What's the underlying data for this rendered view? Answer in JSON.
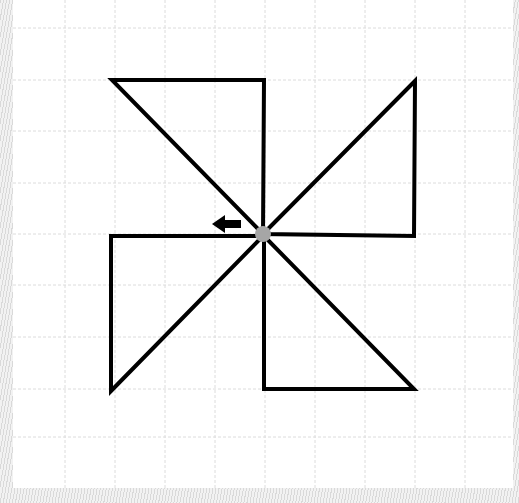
{
  "diagram": {
    "title": "",
    "grid": {
      "vertical_lines_x": [
        65,
        115,
        165,
        215,
        265,
        315,
        365,
        415,
        465
      ],
      "horizontal_lines_y": [
        28,
        80,
        131,
        183,
        234,
        285,
        337,
        389,
        437
      ],
      "color": "#d8d8d8"
    },
    "shape_stroke_color": "#000000",
    "triangles": [
      {
        "name": "top-left",
        "points": "112,80 264,80 263,234"
      },
      {
        "name": "top-right",
        "points": "263,234 415,81 414,236"
      },
      {
        "name": "bottom-left",
        "points": "111,236 263,236 111,391"
      },
      {
        "name": "bottom-right",
        "points": "264,236 264,389 414,389"
      }
    ],
    "center_point": {
      "x": 263,
      "y": 234,
      "color": "#a6a6a6"
    },
    "arrow": {
      "direction": "left",
      "x_start": 241,
      "x_end": 212,
      "y": 224
    }
  }
}
